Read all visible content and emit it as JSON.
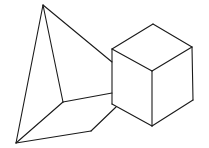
{
  "diagram": {
    "background": "#ffffff",
    "stroke_color": "#1a1a1a",
    "shapes": [
      {
        "name": "pyramid",
        "vertices": {
          "apex": [
            43,
            5
          ],
          "base_left": [
            16,
            143
          ],
          "base_inner": [
            63,
            102
          ],
          "base_front": [
            91,
            131
          ],
          "base_right_hidden_a": [
            112,
            62
          ],
          "base_right_inner": [
            112,
            93
          ],
          "base_right_front": [
            116,
            107
          ]
        },
        "edges": [
          [
            "apex",
            "base_left"
          ],
          [
            "apex",
            "base_inner"
          ],
          [
            "apex",
            "base_right_hidden_a"
          ],
          [
            "base_left",
            "base_inner"
          ],
          [
            "base_left",
            "base_front"
          ],
          [
            "base_inner",
            "base_right_inner"
          ],
          [
            "base_front",
            "base_right_front"
          ]
        ]
      },
      {
        "name": "cube",
        "vertices": {
          "top": [
            153,
            24
          ],
          "left_top": [
            112,
            49
          ],
          "right_top": [
            192,
            47
          ],
          "center": [
            152,
            71
          ],
          "left_bottom": [
            112,
            104
          ],
          "right_bottom": [
            193,
            100
          ],
          "bottom": [
            152,
            126
          ]
        },
        "edges": [
          [
            "top",
            "left_top"
          ],
          [
            "top",
            "right_top"
          ],
          [
            "left_top",
            "center"
          ],
          [
            "right_top",
            "center"
          ],
          [
            "left_top",
            "left_bottom"
          ],
          [
            "right_top",
            "right_bottom"
          ],
          [
            "center",
            "bottom"
          ],
          [
            "left_bottom",
            "bottom"
          ],
          [
            "right_bottom",
            "bottom"
          ]
        ]
      }
    ]
  }
}
